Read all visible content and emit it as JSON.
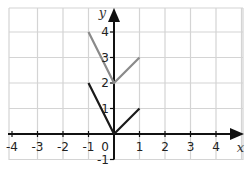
{
  "chart_data": {
    "type": "line",
    "title": "",
    "xlabel": "x",
    "ylabel": "y",
    "xlim": [
      -4,
      4
    ],
    "ylim": [
      -1,
      4
    ],
    "grid": true,
    "x_ticks": [
      "-4",
      "-3",
      "-2",
      "-1",
      "0",
      "1",
      "2",
      "3",
      "4"
    ],
    "y_ticks": [
      "-1",
      "1",
      "2",
      "3",
      "4"
    ],
    "origin_label": "0",
    "series": [
      {
        "name": "black-v",
        "color": "#1a1a1a",
        "points": [
          [
            -1,
            2
          ],
          [
            0,
            0
          ],
          [
            1,
            1
          ]
        ]
      },
      {
        "name": "gray-v",
        "color": "#8a8a8a",
        "points": [
          [
            -1,
            4
          ],
          [
            0,
            2
          ],
          [
            1,
            3
          ]
        ]
      }
    ],
    "colors": {
      "grid": "#d4d4d4",
      "axis": "#111111"
    }
  }
}
